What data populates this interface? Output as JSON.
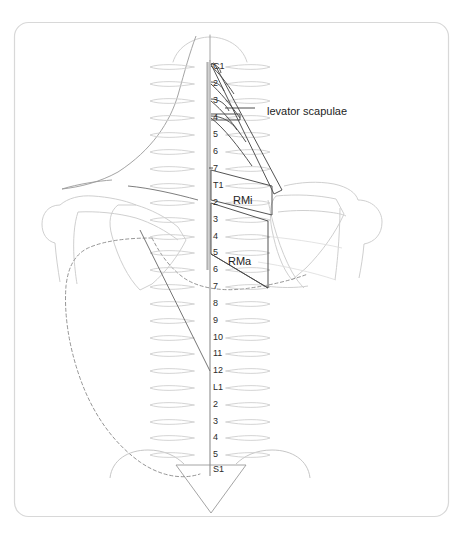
{
  "figure": {
    "frame": {
      "border_color": "#d8d8d8",
      "background": "#ffffff",
      "corner_radius": 14
    },
    "colors": {
      "outline_light": "#c9c9c9",
      "outline_mid": "#9a9a9a",
      "outline_dark": "#555555",
      "muscle_stroke": "#4a4a4a",
      "spine_stroke": "#6a6a6a",
      "rib_stroke": "#cfcfcf",
      "dashed_stroke": "#8a8a8a",
      "text": "#1d1d1d",
      "label_text": "#2b2b2b"
    }
  },
  "annotations": [
    {
      "id": "levator-scapulae",
      "label": "levator scapulae",
      "text_x": 267,
      "text_y": 112,
      "leader": {
        "x1": 255,
        "y1": 108,
        "x2": 225,
        "y2": 108
      }
    },
    {
      "id": "rhomboid-minor",
      "label": "RMi",
      "text_x": 233,
      "text_y": 201
    },
    {
      "id": "rhomboid-major",
      "label": "RMa",
      "text_x": 228,
      "text_y": 262
    }
  ],
  "spine": {
    "axis_x": 210,
    "top_y": 60,
    "bottom_y": 476,
    "segments": [
      {
        "label": "C1",
        "y": 67,
        "region": "cervical"
      },
      {
        "label": "2",
        "y": 84,
        "region": "cervical"
      },
      {
        "label": "3",
        "y": 101,
        "region": "cervical"
      },
      {
        "label": "4",
        "y": 118,
        "region": "cervical"
      },
      {
        "label": "5",
        "y": 135,
        "region": "cervical"
      },
      {
        "label": "6",
        "y": 152,
        "region": "cervical"
      },
      {
        "label": "7",
        "y": 169,
        "region": "cervical"
      },
      {
        "label": "T1",
        "y": 186,
        "region": "thoracic"
      },
      {
        "label": "2",
        "y": 203,
        "region": "thoracic"
      },
      {
        "label": "3",
        "y": 220,
        "region": "thoracic"
      },
      {
        "label": "4",
        "y": 237,
        "region": "thoracic"
      },
      {
        "label": "5",
        "y": 253,
        "region": "thoracic"
      },
      {
        "label": "6",
        "y": 270,
        "region": "thoracic"
      },
      {
        "label": "7",
        "y": 287,
        "region": "thoracic"
      },
      {
        "label": "8",
        "y": 304,
        "region": "thoracic"
      },
      {
        "label": "9",
        "y": 321,
        "region": "thoracic"
      },
      {
        "label": "10",
        "y": 338,
        "region": "thoracic"
      },
      {
        "label": "11",
        "y": 354,
        "region": "thoracic"
      },
      {
        "label": "12",
        "y": 371,
        "region": "thoracic"
      },
      {
        "label": "L1",
        "y": 388,
        "region": "lumbar"
      },
      {
        "label": "2",
        "y": 405,
        "region": "lumbar"
      },
      {
        "label": "3",
        "y": 422,
        "region": "lumbar"
      },
      {
        "label": "4",
        "y": 438,
        "region": "lumbar"
      },
      {
        "label": "5",
        "y": 455,
        "region": "lumbar"
      },
      {
        "label": "S1",
        "y": 470,
        "region": "sacral"
      }
    ]
  }
}
